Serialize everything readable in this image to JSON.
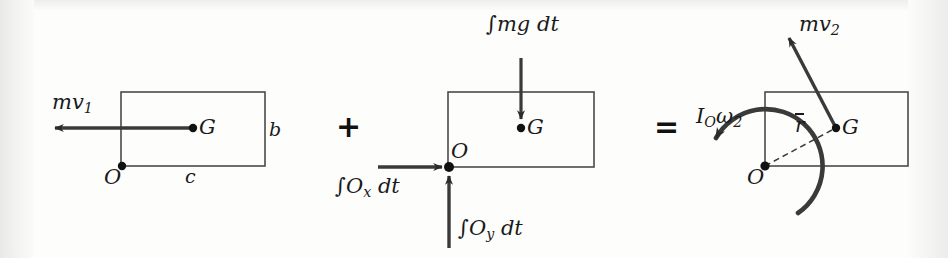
{
  "figure": {
    "type": "impulse-momentum-diagram",
    "background_color": "#fdfdfc",
    "ink_color": "#1a1a1a",
    "operators": [
      {
        "name": "plus",
        "symbol": "+",
        "x": 345,
        "y": 127
      },
      {
        "name": "equals",
        "symbol": "=",
        "x": 663,
        "y": 128
      }
    ]
  },
  "panels": {
    "left": {
      "name": "initial-momentum-panel",
      "rect": {
        "x": 121,
        "y": 92,
        "w": 144,
        "h": 74
      },
      "points": [
        {
          "name": "G",
          "label": "G",
          "x": 193,
          "y": 128,
          "label_x": 200,
          "label_y": 119
        },
        {
          "name": "O",
          "label": "O",
          "x": 122,
          "y": 166,
          "label_x": 105,
          "label_y": 170
        }
      ],
      "vectors": [
        {
          "name": "mv1",
          "label": "mv",
          "sub": "1",
          "from_x": 193,
          "from_y": 128,
          "to_x": 47,
          "to_y": 128,
          "label_x": 52,
          "label_y": 96
        }
      ],
      "dimensions": [
        {
          "name": "b",
          "label": "b",
          "x": 271,
          "y": 122
        },
        {
          "name": "c",
          "label": "c",
          "x": 188,
          "y": 172
        }
      ]
    },
    "middle": {
      "name": "impulse-panel",
      "rect": {
        "x": 448,
        "y": 92,
        "w": 146,
        "h": 75
      },
      "points": [
        {
          "name": "G",
          "label": "G",
          "x": 521,
          "y": 128,
          "label_x": 528,
          "label_y": 119
        },
        {
          "name": "O",
          "label": "O",
          "x": 449,
          "y": 167,
          "label_x": 452,
          "label_y": 142
        }
      ],
      "vectors": [
        {
          "name": "weight-impulse",
          "label": "∫mg dt",
          "from_x": 521,
          "from_y": 58,
          "to_x": 521,
          "to_y": 124,
          "label_x": 487,
          "label_y": 18
        },
        {
          "name": "Ox-impulse",
          "label": "∫O",
          "sub": "x",
          "label_tail": " dt",
          "from_x": 378,
          "from_y": 167,
          "to_x": 447,
          "to_y": 167,
          "label_x": 336,
          "label_y": 180
        },
        {
          "name": "Oy-impulse",
          "label": "∫O",
          "sub": "y",
          "label_tail": " dt",
          "from_x": 449,
          "from_y": 248,
          "to_x": 449,
          "to_y": 170,
          "label_x": 459,
          "label_y": 222
        }
      ]
    },
    "right": {
      "name": "final-momentum-panel",
      "rect": {
        "x": 765,
        "y": 92,
        "w": 143,
        "h": 74
      },
      "points": [
        {
          "name": "G",
          "label": "G",
          "x": 836,
          "y": 128,
          "label_x": 843,
          "label_y": 119
        },
        {
          "name": "O",
          "label": "O",
          "x": 765,
          "y": 166,
          "label_x": 748,
          "label_y": 170
        }
      ],
      "vectors": [
        {
          "name": "mv2",
          "label": "mv",
          "sub": "2",
          "from_x": 836,
          "from_y": 128,
          "to_x": 785,
          "to_y": 31,
          "label_x": 800,
          "label_y": 18
        },
        {
          "name": "angular-momentum",
          "label": "I",
          "sub": "O",
          "label_tail": "ω",
          "sub2": "2",
          "label_x": 697,
          "label_y": 111,
          "arc_center_x": 765,
          "arc_center_y": 166,
          "arc_radius": 57,
          "arc_start_deg": -55,
          "arc_end_deg": 152
        }
      ],
      "radius_line": {
        "name": "r-bar",
        "label": "r",
        "from_x": 765,
        "from_y": 166,
        "to_x": 836,
        "to_y": 128,
        "label_x": 797,
        "label_y": 119
      }
    }
  }
}
